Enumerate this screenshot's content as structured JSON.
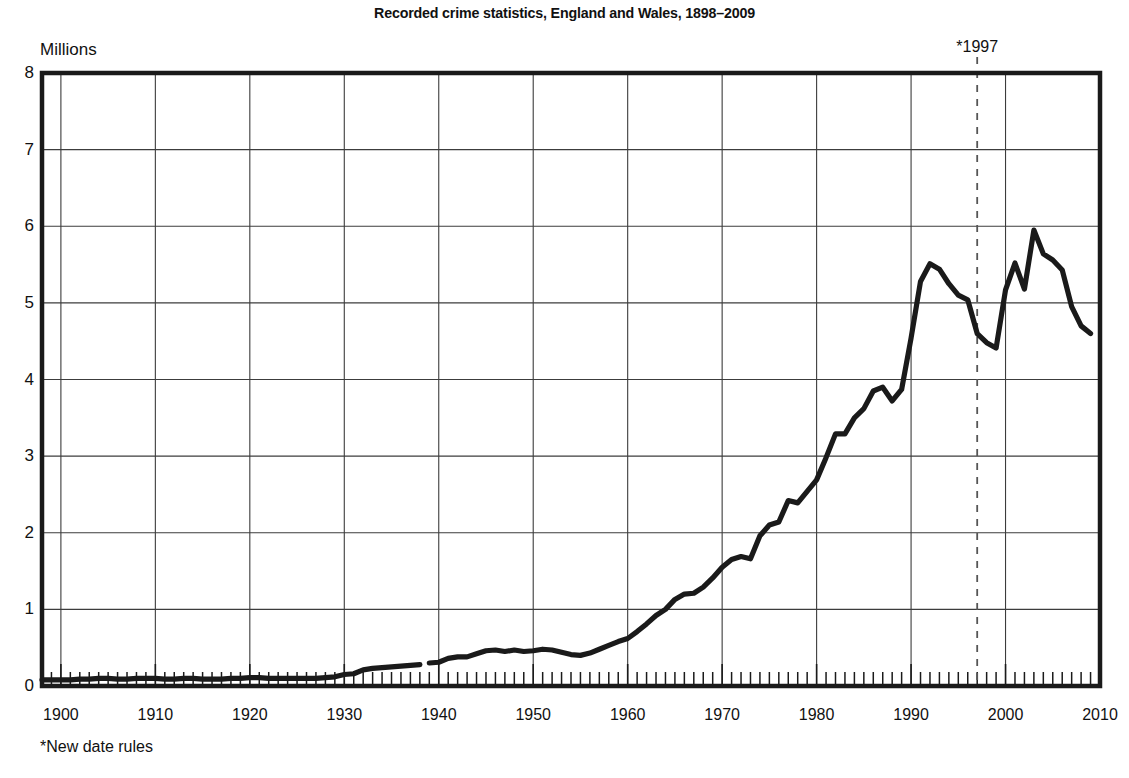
{
  "chart_data": {
    "type": "line",
    "title": "Recorded crime statistics, England and Wales, 1898–2009",
    "xlabel": "",
    "ylabel": "Millions",
    "unit_label": "Millions",
    "footnote": "*New date rules",
    "grid": true,
    "legend": "none",
    "xlim": [
      1898,
      2010
    ],
    "ylim": [
      0,
      8
    ],
    "yticks": [
      0,
      1,
      2,
      3,
      4,
      5,
      6,
      7,
      8
    ],
    "ytick_labels": [
      "0",
      "1",
      "2",
      "3",
      "4",
      "5",
      "6",
      "7",
      "8"
    ],
    "xticks": [
      1900,
      1910,
      1920,
      1930,
      1940,
      1950,
      1960,
      1970,
      1980,
      1990,
      2000,
      2010
    ],
    "xtick_labels": [
      "1900",
      "1910",
      "1920",
      "1930",
      "1940",
      "1950",
      "1960",
      "1970",
      "1980",
      "1990",
      "2000",
      "2010"
    ],
    "minor_xtick_interval": 1,
    "annotations": [
      {
        "label": "*1997",
        "x": 1997,
        "style": "dashed-vertical-line",
        "color": "#555555"
      }
    ],
    "series": [
      {
        "name": "Recorded crime (pre-1939 counting rules)",
        "color": "#1a1a1a",
        "x": [
          1898,
          1899,
          1900,
          1901,
          1902,
          1903,
          1904,
          1905,
          1906,
          1907,
          1908,
          1909,
          1910,
          1911,
          1912,
          1913,
          1914,
          1915,
          1916,
          1917,
          1918,
          1919,
          1920,
          1921,
          1922,
          1923,
          1924,
          1925,
          1926,
          1927,
          1928,
          1929,
          1930,
          1931,
          1932,
          1933,
          1934,
          1935,
          1936,
          1937,
          1938
        ],
        "values": [
          0.08,
          0.08,
          0.08,
          0.08,
          0.09,
          0.09,
          0.1,
          0.1,
          0.09,
          0.09,
          0.1,
          0.1,
          0.1,
          0.09,
          0.09,
          0.1,
          0.1,
          0.09,
          0.09,
          0.09,
          0.1,
          0.1,
          0.11,
          0.11,
          0.1,
          0.1,
          0.1,
          0.1,
          0.1,
          0.1,
          0.11,
          0.12,
          0.15,
          0.16,
          0.21,
          0.23,
          0.24,
          0.25,
          0.26,
          0.27,
          0.28
        ]
      },
      {
        "name": "Recorded crime (new date rules, 1939 onward)",
        "color": "#1a1a1a",
        "x": [
          1939,
          1940,
          1941,
          1942,
          1943,
          1944,
          1945,
          1946,
          1947,
          1948,
          1949,
          1950,
          1951,
          1952,
          1953,
          1954,
          1955,
          1956,
          1957,
          1958,
          1959,
          1960,
          1961,
          1962,
          1963,
          1964,
          1965,
          1966,
          1967,
          1968,
          1969,
          1970,
          1971,
          1972,
          1973,
          1974,
          1975,
          1976,
          1977,
          1978,
          1979,
          1980,
          1981,
          1982,
          1983,
          1984,
          1985,
          1986,
          1987,
          1988,
          1989,
          1990,
          1991,
          1992,
          1993,
          1994,
          1995,
          1996,
          1997,
          1998,
          1999,
          2000,
          2001,
          2002,
          2003,
          2004,
          2005,
          2006,
          2007,
          2008,
          2009
        ],
        "values": [
          0.3,
          0.31,
          0.36,
          0.38,
          0.38,
          0.42,
          0.46,
          0.47,
          0.45,
          0.47,
          0.45,
          0.46,
          0.48,
          0.47,
          0.44,
          0.41,
          0.4,
          0.43,
          0.48,
          0.53,
          0.58,
          0.62,
          0.71,
          0.81,
          0.92,
          1.0,
          1.13,
          1.2,
          1.21,
          1.29,
          1.41,
          1.55,
          1.65,
          1.69,
          1.66,
          1.96,
          2.1,
          2.14,
          2.42,
          2.39,
          2.54,
          2.69,
          2.98,
          3.29,
          3.29,
          3.5,
          3.62,
          3.85,
          3.9,
          3.72,
          3.87,
          4.54,
          5.28,
          5.51,
          5.44,
          5.25,
          5.1,
          5.04,
          4.6,
          4.48,
          4.41,
          5.17,
          5.52,
          5.18,
          5.95,
          5.64,
          5.56,
          5.43,
          4.95,
          4.7,
          4.6
        ],
        "note": "second value 1939 starts after break following *New date rules"
      }
    ]
  },
  "layout": {
    "plot_left_px": 42,
    "plot_right_px": 1100,
    "plot_top_px": 73,
    "plot_bottom_px": 686
  }
}
